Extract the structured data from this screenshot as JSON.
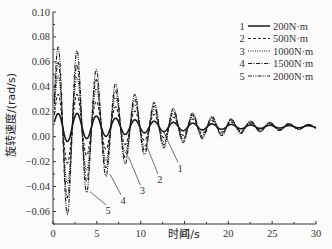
{
  "chart_data": {
    "type": "line",
    "title": "",
    "xlabel": "时间/s",
    "ylabel": "旋转速度/(rad/s)",
    "xlim": [
      0,
      30
    ],
    "ylim": [
      -0.07,
      0.1
    ],
    "x_ticks": [
      "0",
      "5",
      "10",
      "15",
      "20",
      "25",
      "30"
    ],
    "y_ticks": [
      "0.10",
      "0.08",
      "0.06",
      "0.04",
      "0.02",
      "0.00",
      "-0.02",
      "-0.04",
      "-0.06"
    ],
    "grid": false,
    "legend_position": "upper right",
    "series": [
      {
        "id": "1",
        "name": "200N·m",
        "style": "solid",
        "amplitude0": 0.014,
        "decay": 0.1,
        "period": 2.2,
        "offset": 0.008
      },
      {
        "id": "2",
        "name": "500N·m",
        "style": "dashed",
        "amplitude0": 0.035,
        "decay": 0.11,
        "period": 2.2,
        "offset": 0.008
      },
      {
        "id": "3",
        "name": "1000N·m",
        "style": "dotted",
        "amplitude0": 0.055,
        "decay": 0.12,
        "period": 2.2,
        "offset": 0.008
      },
      {
        "id": "4",
        "name": "1500N·m",
        "style": "dashdot",
        "amplitude0": 0.07,
        "decay": 0.125,
        "period": 2.2,
        "offset": 0.008
      },
      {
        "id": "5",
        "name": "2000N·m",
        "style": "dashdotdot",
        "amplitude0": 0.087,
        "decay": 0.13,
        "period": 2.2,
        "offset": 0.008
      }
    ],
    "approx_peaks_series5": {
      "x": [
        1.1,
        3.3,
        5.5,
        7.7,
        9.9,
        12.1,
        14.3,
        16.5,
        18.7,
        20.9
      ],
      "y": [
        0.095,
        0.072,
        0.053,
        0.04,
        0.03,
        0.022,
        0.018,
        0.015,
        0.013,
        0.011
      ]
    },
    "approx_troughs_series5": {
      "x": [
        2.2,
        4.4,
        6.6,
        8.8,
        11.0,
        13.2
      ],
      "y": [
        -0.068,
        -0.048,
        -0.032,
        -0.02,
        -0.01,
        -0.004
      ]
    },
    "annotations": [
      {
        "label": "1",
        "x": 14.5,
        "y": -0.028
      },
      {
        "label": "2",
        "x": 12.2,
        "y": -0.037
      },
      {
        "label": "3",
        "x": 10.2,
        "y": -0.046
      },
      {
        "label": "4",
        "x": 8.0,
        "y": -0.054
      },
      {
        "label": "5",
        "x": 6.3,
        "y": -0.062
      }
    ]
  }
}
